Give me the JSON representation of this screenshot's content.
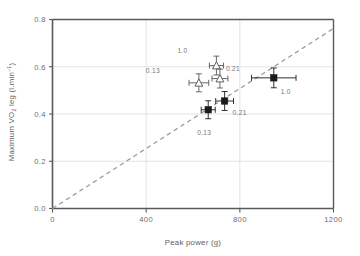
{
  "chart_data": {
    "type": "scatter",
    "title": "",
    "xlabel": "Peak power (g)",
    "ylabel": "Maximum VO2 leg (l.min-1)",
    "ylabel_parts": {
      "prefix": "Maximum ",
      "vdot": "V",
      "o": "O",
      "sub": "2",
      "mid": " leg (l.min",
      "sup": "−1",
      "suffix": ")"
    },
    "xlim": [
      0,
      1200
    ],
    "ylim": [
      0.0,
      0.8
    ],
    "xticks": [
      0,
      400,
      800,
      1200
    ],
    "xtick_labels": [
      "0",
      "400",
      "800",
      "1200"
    ],
    "yticks": [
      0.0,
      0.2,
      0.4,
      0.6,
      0.8
    ],
    "ytick_labels": [
      "0.0",
      "0.2",
      "0.4",
      "0.6",
      "0.8"
    ],
    "grid": "horizontal-and-vertical-light",
    "legend": "none",
    "identity_line": {
      "style": "dashed",
      "color": "#9a9a9a",
      "from": [
        0,
        0.0
      ],
      "to": [
        1200,
        0.762
      ]
    },
    "series": [
      {
        "name": "open-triangle",
        "marker": "triangle-open",
        "color": "#55595c",
        "points": [
          {
            "label": "0.13",
            "x": 625,
            "y": 0.532,
            "xerr": 42,
            "yerr": 0.038,
            "label_dx": -46,
            "label_dy": -10
          },
          {
            "label": "1.0",
            "x": 700,
            "y": 0.605,
            "xerr": 30,
            "yerr": 0.04,
            "label_dx": -34,
            "label_dy": -13
          },
          {
            "label": "0.21",
            "x": 715,
            "y": 0.55,
            "xerr": 34,
            "yerr": 0.04,
            "label_dx": 13,
            "label_dy": -8
          }
        ]
      },
      {
        "name": "filled-square",
        "marker": "square-filled",
        "color": "#1b1b1b",
        "points": [
          {
            "label": "0.13",
            "x": 665,
            "y": 0.418,
            "xerr": 30,
            "yerr": 0.038,
            "label_dx": -4,
            "label_dy": 25
          },
          {
            "label": "0.21",
            "x": 735,
            "y": 0.455,
            "xerr": 38,
            "yerr": 0.04,
            "label_dx": 15,
            "label_dy": 14
          },
          {
            "label": "1.0",
            "x": 945,
            "y": 0.553,
            "xerr": 95,
            "yerr": 0.042,
            "label_dx": 12,
            "label_dy": 16
          }
        ]
      }
    ],
    "colors": {
      "axis": "#58595b",
      "grid": "#dcdcdc",
      "text": "#6d6d6d",
      "dashed_line": "#9a9a9a",
      "marker_open": "#55595c",
      "marker_filled": "#1b1b1b"
    }
  }
}
